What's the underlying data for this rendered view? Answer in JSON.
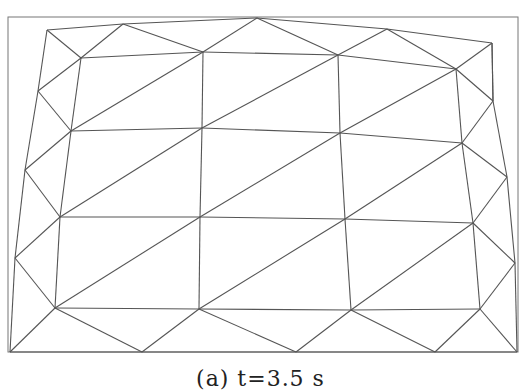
{
  "figure": {
    "caption": "(a) t=3.5 s",
    "line_color": "#555555",
    "frame": {
      "x1": 8,
      "y1": 17,
      "x2": 518,
      "y2": 352
    },
    "nodes": {
      "a0": [
        47,
        30
      ],
      "a1": [
        123,
        24
      ],
      "a2": [
        257,
        18
      ],
      "a3": [
        387,
        29
      ],
      "a4": [
        492,
        43
      ],
      "b0": [
        81,
        58
      ],
      "b1": [
        203,
        52
      ],
      "b2": [
        338,
        55
      ],
      "b3": [
        456,
        69
      ],
      "c0": [
        38,
        91
      ],
      "c4": [
        493,
        101
      ],
      "d0": [
        71,
        131
      ],
      "d1": [
        202,
        128
      ],
      "d2": [
        340,
        133
      ],
      "d3": [
        462,
        143
      ],
      "e0": [
        25,
        170
      ],
      "e4": [
        507,
        177
      ],
      "f0": [
        60,
        217
      ],
      "f1": [
        200,
        217
      ],
      "f2": [
        345,
        219
      ],
      "f3": [
        473,
        223
      ],
      "g0": [
        15,
        258
      ],
      "g4": [
        515,
        263
      ],
      "h0": [
        55,
        308
      ],
      "h1": [
        199,
        309
      ],
      "h2": [
        351,
        310
      ],
      "h3": [
        480,
        309
      ],
      "i0": [
        10,
        352
      ],
      "i1": [
        142,
        352
      ],
      "i2": [
        296,
        352
      ],
      "i3": [
        435,
        352
      ],
      "i4": [
        517,
        352
      ]
    },
    "edges": [
      [
        "a0",
        "a1"
      ],
      [
        "a1",
        "a2"
      ],
      [
        "a2",
        "a3"
      ],
      [
        "a3",
        "a4"
      ],
      [
        "a0",
        "b0"
      ],
      [
        "a1",
        "b0"
      ],
      [
        "a2",
        "b1"
      ],
      [
        "a2",
        "b2"
      ],
      [
        "a3",
        "b2"
      ],
      [
        "a3",
        "b3"
      ],
      [
        "a4",
        "b3"
      ],
      [
        "b0",
        "b1"
      ],
      [
        "b1",
        "b2"
      ],
      [
        "b2",
        "b3"
      ],
      [
        "a1",
        "b1"
      ],
      [
        "a0",
        "c0"
      ],
      [
        "b0",
        "c0"
      ],
      [
        "a4",
        "c4"
      ],
      [
        "b3",
        "c4"
      ],
      [
        "c0",
        "d0"
      ],
      [
        "b0",
        "d0"
      ],
      [
        "c4",
        "d3"
      ],
      [
        "b3",
        "d3"
      ],
      [
        "a4",
        "c4"
      ],
      [
        "d0",
        "d1"
      ],
      [
        "d1",
        "d2"
      ],
      [
        "d2",
        "d3"
      ],
      [
        "b1",
        "d1"
      ],
      [
        "b2",
        "d2"
      ],
      [
        "d0",
        "b1"
      ],
      [
        "d1",
        "b2"
      ],
      [
        "d2",
        "b3"
      ],
      [
        "c0",
        "e0"
      ],
      [
        "d0",
        "e0"
      ],
      [
        "c4",
        "e4"
      ],
      [
        "d3",
        "e4"
      ],
      [
        "e0",
        "f0"
      ],
      [
        "d0",
        "f0"
      ],
      [
        "e4",
        "f3"
      ],
      [
        "d3",
        "f3"
      ],
      [
        "f0",
        "f1"
      ],
      [
        "f1",
        "f2"
      ],
      [
        "f2",
        "f3"
      ],
      [
        "d1",
        "f1"
      ],
      [
        "d2",
        "f2"
      ],
      [
        "f0",
        "d1"
      ],
      [
        "f1",
        "d2"
      ],
      [
        "f2",
        "d3"
      ],
      [
        "e0",
        "g0"
      ],
      [
        "f0",
        "g0"
      ],
      [
        "e4",
        "g4"
      ],
      [
        "f3",
        "g4"
      ],
      [
        "g0",
        "h0"
      ],
      [
        "f0",
        "h0"
      ],
      [
        "g4",
        "h3"
      ],
      [
        "f3",
        "h3"
      ],
      [
        "h0",
        "h1"
      ],
      [
        "h1",
        "h2"
      ],
      [
        "h2",
        "h3"
      ],
      [
        "f1",
        "h1"
      ],
      [
        "f2",
        "h2"
      ],
      [
        "h0",
        "f1"
      ],
      [
        "h1",
        "f2"
      ],
      [
        "h2",
        "f3"
      ],
      [
        "g0",
        "i0"
      ],
      [
        "h0",
        "i0"
      ],
      [
        "g4",
        "i4"
      ],
      [
        "h3",
        "i4"
      ],
      [
        "i0",
        "i1"
      ],
      [
        "i1",
        "i2"
      ],
      [
        "i2",
        "i3"
      ],
      [
        "i3",
        "i4"
      ],
      [
        "h0",
        "i1"
      ],
      [
        "h1",
        "i1"
      ],
      [
        "h1",
        "i2"
      ],
      [
        "h2",
        "i2"
      ],
      [
        "h2",
        "i3"
      ],
      [
        "h3",
        "i3"
      ]
    ]
  }
}
